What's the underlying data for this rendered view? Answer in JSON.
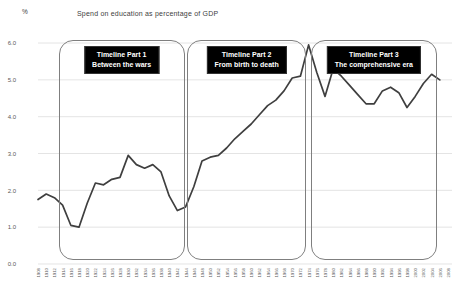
{
  "page": {
    "unit_label": "%",
    "title": "Spend on education as percentage of GDP"
  },
  "chart_data": {
    "type": "line",
    "title": "Spend on education as percentage of GDP",
    "ylabel": "%",
    "xlabel": "",
    "ylim": [
      0.0,
      6.0
    ],
    "ytick_labels": [
      "0.0",
      "1.0",
      "2.0",
      "3.0",
      "4.0",
      "5.0",
      "6.0"
    ],
    "x_start_year": 1908,
    "x_end_year": 2008,
    "xtick_step_years": 2,
    "grid": true,
    "legend": false,
    "line_color": "#3f3f3f",
    "grid_color": "#d9d9d9",
    "tick_text_color": "#595959",
    "series": [
      {
        "name": "Education spend as % of GDP",
        "x": [
          1908,
          1910,
          1912,
          1914,
          1916,
          1918,
          1920,
          1922,
          1924,
          1926,
          1928,
          1930,
          1932,
          1934,
          1936,
          1938,
          1940,
          1942,
          1944,
          1946,
          1948,
          1950,
          1952,
          1954,
          1956,
          1958,
          1960,
          1962,
          1964,
          1966,
          1968,
          1970,
          1972,
          1974,
          1976,
          1978,
          1980,
          1982,
          1984,
          1986,
          1988,
          1990,
          1992,
          1994,
          1996,
          1998,
          2000,
          2002,
          2004,
          2006
        ],
        "y": [
          1.75,
          1.9,
          1.8,
          1.6,
          1.05,
          1.0,
          1.65,
          2.2,
          2.15,
          2.3,
          2.35,
          2.95,
          2.7,
          2.6,
          2.7,
          2.5,
          1.85,
          1.45,
          1.55,
          2.1,
          2.8,
          2.9,
          2.95,
          3.15,
          3.4,
          3.6,
          3.8,
          4.05,
          4.3,
          4.45,
          4.7,
          5.05,
          5.1,
          5.95,
          5.2,
          4.55,
          5.3,
          5.1,
          4.85,
          4.6,
          4.35,
          4.35,
          4.7,
          4.8,
          4.65,
          4.25,
          4.55,
          4.9,
          5.15,
          5.0
        ]
      }
    ],
    "annotations": [
      {
        "label_line1": "Timeline Part 1",
        "label_line2": "Between the wars",
        "year_start": 1913,
        "year_end": 1943.8
      },
      {
        "label_line1": "Timeline Part 2",
        "label_line2": "From birth to death",
        "year_start": 1944.3,
        "year_end": 1973.5
      },
      {
        "label_line1": "Timeline Part 3",
        "label_line2": "The comprehensive era",
        "year_start": 1974.6,
        "year_end": 2005.2
      }
    ]
  }
}
